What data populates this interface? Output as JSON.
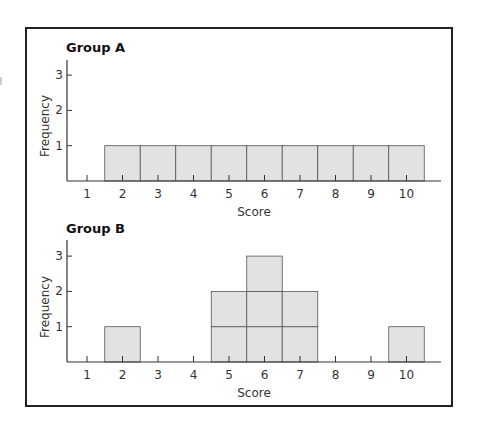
{
  "colors": {
    "bar_fill": "#e2e2e2",
    "bar_stroke": "#555555",
    "axis": "#333333",
    "frame": "#222222"
  },
  "chart_data": [
    {
      "type": "bar",
      "title": "Group A",
      "xlabel": "Score",
      "ylabel": "Frequency",
      "categories": [
        1,
        2,
        3,
        4,
        5,
        6,
        7,
        8,
        9,
        10
      ],
      "values": [
        0,
        1,
        1,
        1,
        1,
        1,
        1,
        1,
        1,
        1
      ],
      "yticks": [
        1,
        2,
        3
      ],
      "ylim": [
        0,
        3.4
      ],
      "grid": false,
      "style": "stacked unit boxes (histogram)"
    },
    {
      "type": "bar",
      "title": "Group B",
      "xlabel": "Score",
      "ylabel": "Frequency",
      "categories": [
        1,
        2,
        3,
        4,
        5,
        6,
        7,
        8,
        9,
        10
      ],
      "values": [
        0,
        1,
        0,
        0,
        2,
        3,
        2,
        0,
        0,
        1
      ],
      "yticks": [
        1,
        2,
        3
      ],
      "ylim": [
        0,
        3.4
      ],
      "grid": false,
      "style": "stacked unit boxes (histogram)"
    }
  ]
}
